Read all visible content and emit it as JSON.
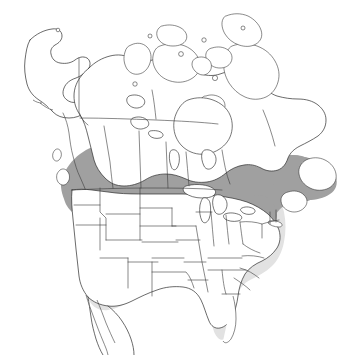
{
  "figure": {
    "type": "species-distribution-map",
    "region": "North America",
    "background_color": "#ffffff",
    "width": 355,
    "height": 355
  },
  "map": {
    "projection_hint": "conic",
    "outline_color": "#2b2b2b",
    "border_color": "#3a3a3a",
    "unshaded_color": "#ffffff"
  },
  "ranges": {
    "breeding": {
      "name": "breeding-range",
      "color": "#a0a0a0",
      "regions": [
        "British Columbia interior",
        "Yukon south",
        "Alberta north",
        "Saskatchewan north",
        "Manitoba",
        "Ontario",
        "Quebec",
        "Labrador",
        "Newfoundland",
        "New Brunswick",
        "Nova Scotia",
        "Maine",
        "New England",
        "Upper Great Lakes"
      ]
    },
    "winter": {
      "name": "winter-range",
      "color": "#e2e2e2",
      "regions": [
        "Great Plains",
        "Midwest",
        "Ohio Valley",
        "Mid-Atlantic",
        "Southeast",
        "Florida",
        "Gulf Coast",
        "Texas",
        "Montana",
        "Dakotas"
      ]
    },
    "absent": {
      "name": "absent-range",
      "color": "#ffffff",
      "regions": [
        "Alaska",
        "Arctic Canada",
        "Hudson Bay",
        "Great Lakes water",
        "Pacific Northwest coast",
        "California",
        "Great Basin",
        "Southwest",
        "Mexico"
      ]
    }
  },
  "features": {
    "water_bodies": [
      "Hudson Bay",
      "Lake Superior",
      "Lake Michigan",
      "Lake Huron",
      "Lake Erie",
      "Lake Ontario",
      "Great Bear Lake",
      "Great Slave Lake",
      "Lake Winnipeg",
      "Gulf of Mexico",
      "Gulf of California"
    ],
    "islands": [
      "Baffin Island",
      "Victoria Island",
      "Banks Island",
      "Ellesmere Island",
      "Newfoundland",
      "Vancouver Island",
      "Queen Charlotte Islands",
      "Southampton Island",
      "Prince of Wales Island",
      "Devon Island",
      "Melville Island",
      "Long Island",
      "Baja California"
    ]
  }
}
